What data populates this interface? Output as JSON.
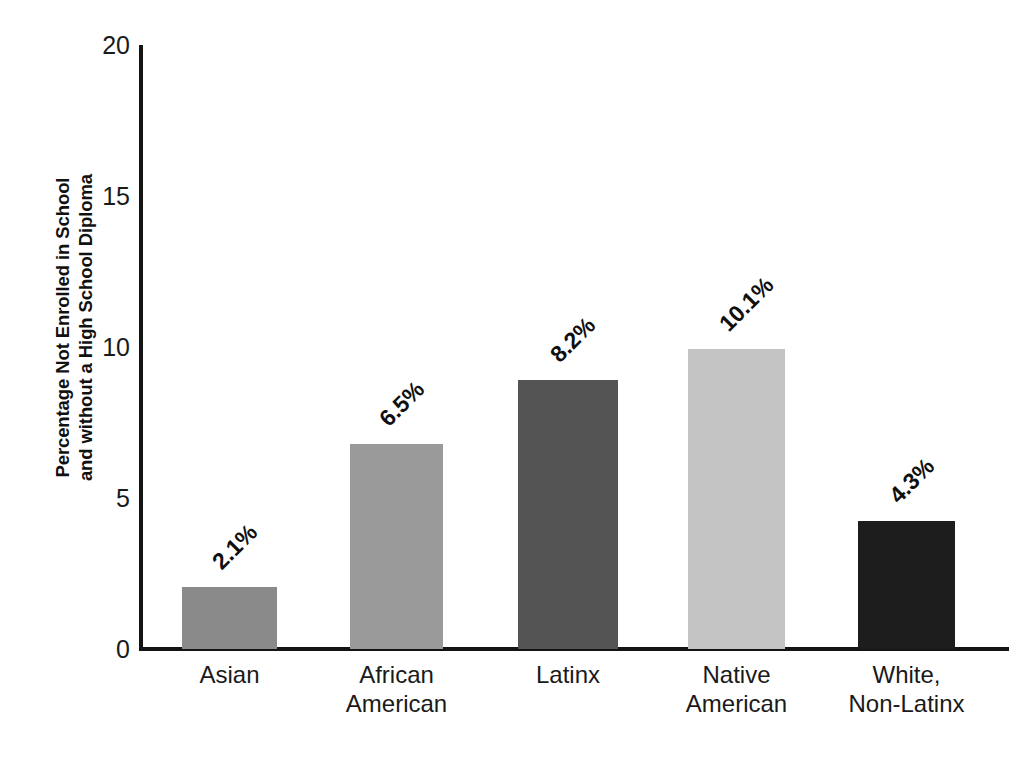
{
  "chart_data": {
    "type": "bar",
    "title": "",
    "xlabel": "",
    "ylabel": "Percentage Not Enrolled in School\nand without a High School Diploma",
    "ylim": [
      0,
      20
    ],
    "yticks": [
      20,
      15,
      10,
      5,
      0
    ],
    "ytick_labels": [
      "20",
      "15",
      "10",
      "5",
      "0"
    ],
    "grid": false,
    "legend": null,
    "categories": [
      "Asian",
      "African\nAmerican",
      "Latinx",
      "Native\nAmerican",
      "White,\nNon-Latinx"
    ],
    "values": [
      2.1,
      6.5,
      8.2,
      10.1,
      4.3
    ],
    "data_labels": [
      "2.1%",
      "6.5%",
      "8.2%",
      "10.1%",
      "4.3%"
    ],
    "bar_colors": [
      "#8a8a8a",
      "#9a9a9a",
      "#545454",
      "#c4c4c4",
      "#1d1d1d"
    ],
    "bars": [
      {
        "category": "Asian",
        "label_line1": "Asian",
        "label_line2": "",
        "value": 2.1,
        "data_label": "2.1%",
        "plot_height": 2.05,
        "color": "#8a8a8a",
        "x": 40,
        "width": 95
      },
      {
        "category": "African American",
        "label_line1": "African",
        "label_line2": "American",
        "value": 6.5,
        "data_label": "6.5%",
        "plot_height": 6.8,
        "color": "#9a9a9a",
        "x": 208,
        "width": 93
      },
      {
        "category": "Latinx",
        "label_line1": "Latinx",
        "label_line2": "",
        "value": 8.2,
        "data_label": "8.2%",
        "plot_height": 8.92,
        "color": "#545454",
        "x": 376,
        "width": 100
      },
      {
        "category": "Native American",
        "label_line1": "Native",
        "label_line2": "American",
        "value": 10.1,
        "data_label": "10.1%",
        "plot_height": 9.93,
        "color": "#c4c4c4",
        "x": 546,
        "width": 97
      },
      {
        "category": "White, Non-Latinx",
        "label_line1": "White,",
        "label_line2": "Non-Latinx",
        "value": 4.3,
        "data_label": "4.3%",
        "plot_height": 4.25,
        "color": "#1d1d1d",
        "x": 716,
        "width": 97
      }
    ]
  }
}
